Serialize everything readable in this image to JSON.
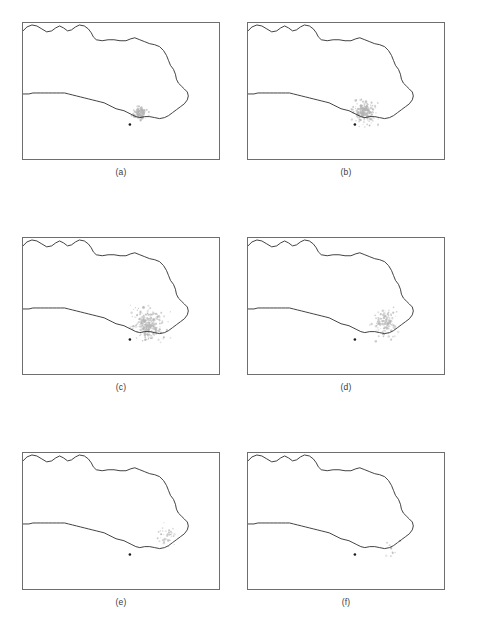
{
  "figure": {
    "type": "multi-panel-map-figure",
    "panel_count": 6,
    "columns": 2,
    "rows": 3,
    "background_color": "#ffffff",
    "coastline_color": "#2b2b2b",
    "plume_color": "#b4b4b4",
    "reference_marker_color": "#1a1a1a",
    "frame_color": "#6e6e6e"
  },
  "chart_data": {
    "type": "scatter",
    "title": "",
    "xlabel": "",
    "ylabel": "",
    "xlim": [
      0,
      198
    ],
    "ylim": [
      0,
      138
    ],
    "grid": false,
    "legend": null,
    "coastline_path": "M 0,8 L 4,4 L 9,2 L 14,3 L 19,6 L 24,9 L 29,8 L 33,5 L 37,3 L 41,5 L 45,8 L 49,7 L 53,4 L 57,2 L 62,3 L 66,6 L 69,10 L 71,14 L 74,17 L 80,18 L 86,17 L 92,17 L 98,18 L 104,18 L 109,16 L 113,15 L 118,17 L 123,19 L 128,21 L 133,22 L 138,24 L 142,28 L 145,33 L 147,38 L 149,43 L 152,47 L 154,52 L 155,57 L 157,61 L 160,64 L 163,67 L 166,70 L 167,74 L 166,78 L 163,82 L 159,85 L 155,88 L 151,91 L 147,94 L 143,96 L 138,97 L 133,96 L 128,95 L 123,95 L 118,96 L 114,95 L 110,93 L 106,91 L 102,89 L 98,88 L 94,87 L 90,85 L 86,83 L 82,81 L 78,80 L 74,79 L 70,78 L 66,77 L 62,76 L 58,75 L 54,74 L 50,73 L 46,72 L 42,71 L 38,71 L 34,71 L 30,71 L 26,71 L 22,71 L 18,71 L 14,71 L 10,71 L 6,72 L 2,72 L 0,72",
    "reference_marker": {
      "x": 108,
      "y": 103,
      "radius": 1.3
    },
    "panels": [
      {
        "id": "a",
        "caption": "(a)",
        "plume_extent": {
          "x_min": 108,
          "x_max": 128,
          "y_min": 84,
          "y_max": 100
        },
        "plume_point_count": 160,
        "plume_spread": "compact",
        "plume_center": {
          "x": 118,
          "y": 92
        },
        "plume_radius": 7
      },
      {
        "id": "b",
        "caption": "(b)",
        "plume_extent": {
          "x_min": 104,
          "x_max": 132,
          "y_min": 76,
          "y_max": 106
        },
        "plume_point_count": 230,
        "plume_spread": "moderate",
        "plume_center": {
          "x": 118,
          "y": 90
        },
        "plume_radius": 11
      },
      {
        "id": "c",
        "caption": "(c)",
        "plume_extent": {
          "x_min": 108,
          "x_max": 150,
          "y_min": 68,
          "y_max": 112
        },
        "plume_point_count": 300,
        "plume_spread": "wide",
        "plume_center": {
          "x": 126,
          "y": 88
        },
        "plume_radius": 16
      },
      {
        "id": "d",
        "caption": "(d)",
        "plume_extent": {
          "x_min": 120,
          "x_max": 152,
          "y_min": 62,
          "y_max": 112
        },
        "plume_point_count": 150,
        "plume_spread": "elongated-along-coast",
        "plume_center": {
          "x": 138,
          "y": 86
        },
        "plume_radius": 15
      },
      {
        "id": "e",
        "caption": "(e)",
        "plume_extent": {
          "x_min": 132,
          "x_max": 154,
          "y_min": 70,
          "y_max": 104
        },
        "plume_point_count": 45,
        "plume_spread": "sparse",
        "plume_center": {
          "x": 144,
          "y": 86
        },
        "plume_radius": 12
      },
      {
        "id": "f",
        "caption": "(f)",
        "plume_extent": {
          "x_min": 136,
          "x_max": 156,
          "y_min": 74,
          "y_max": 116
        },
        "plume_point_count": 14,
        "plume_spread": "trace",
        "plume_center": {
          "x": 147,
          "y": 100
        },
        "plume_radius": 11
      }
    ]
  }
}
